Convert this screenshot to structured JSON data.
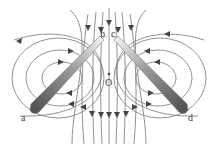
{
  "diagram": {
    "type": "magnetic-field-lines",
    "labels": {
      "a": "a",
      "b": "b",
      "c": "c",
      "d": "d",
      "center": "O"
    },
    "colors": {
      "field_line": "#777777",
      "arrow": "#444444",
      "rod_dark": "#5a5a5a",
      "rod_light": "#f0f0f0",
      "axis": "#999999"
    }
  }
}
